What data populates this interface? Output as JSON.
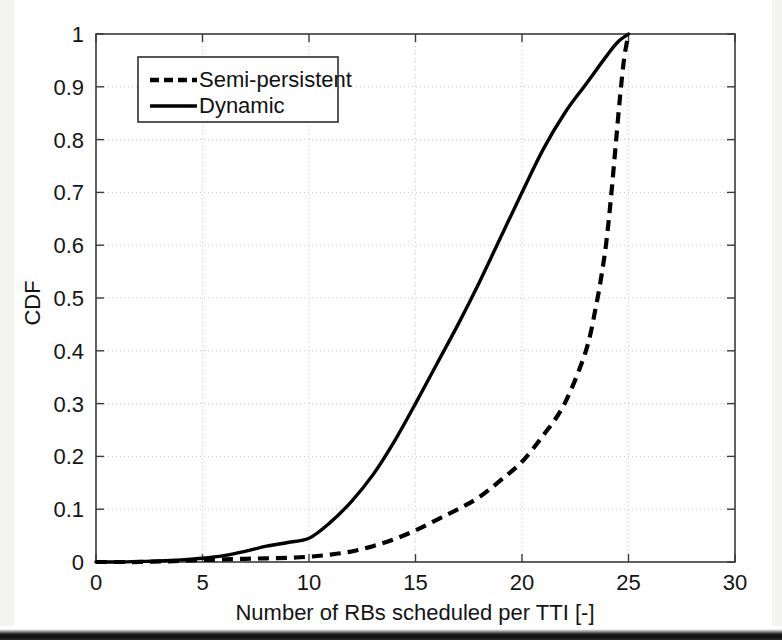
{
  "chart_data": {
    "type": "line",
    "title": "",
    "xlabel": "Number of RBs scheduled per TTI [-]",
    "ylabel": "CDF",
    "xlim": [
      0,
      30
    ],
    "ylim": [
      0,
      1
    ],
    "grid": true,
    "legend_position": "top-left",
    "xticks": [
      "0",
      "5",
      "10",
      "15",
      "20",
      "25",
      "30"
    ],
    "xtick_values": [
      0,
      5,
      10,
      15,
      20,
      25,
      30
    ],
    "yticks": [
      "0",
      "0.1",
      "0.2",
      "0.3",
      "0.4",
      "0.5",
      "0.6",
      "0.7",
      "0.8",
      "0.9",
      "1"
    ],
    "ytick_values": [
      0,
      0.1,
      0.2,
      0.3,
      0.4,
      0.5,
      0.6,
      0.7,
      0.8,
      0.9,
      1.0
    ],
    "series": [
      {
        "name": "Semi-persistent",
        "style": "dashed",
        "color": "#000000",
        "x": [
          0,
          1,
          2,
          3,
          4,
          5,
          6,
          7,
          8,
          9,
          10,
          11,
          12,
          13,
          14,
          15,
          16,
          17,
          18,
          19,
          20,
          21,
          22,
          23,
          23.5,
          23.8,
          24.0,
          24.2,
          24.4,
          24.6,
          24.8,
          25.0
        ],
        "values": [
          0.0,
          0.0,
          0.0,
          0.001,
          0.002,
          0.004,
          0.005,
          0.006,
          0.007,
          0.008,
          0.01,
          0.014,
          0.02,
          0.03,
          0.043,
          0.06,
          0.08,
          0.1,
          0.123,
          0.155,
          0.19,
          0.24,
          0.3,
          0.4,
          0.49,
          0.56,
          0.62,
          0.7,
          0.79,
          0.88,
          0.955,
          1.0
        ]
      },
      {
        "name": "Dynamic",
        "style": "solid",
        "color": "#000000",
        "x": [
          0,
          1,
          2,
          3,
          4,
          5,
          6,
          7,
          8,
          9,
          10,
          11,
          12,
          13,
          14,
          15,
          16,
          17,
          18,
          19,
          20,
          21,
          22,
          23,
          24,
          24.5,
          25.0
        ],
        "values": [
          0.0,
          0.0,
          0.001,
          0.002,
          0.004,
          0.007,
          0.012,
          0.02,
          0.03,
          0.037,
          0.045,
          0.075,
          0.115,
          0.165,
          0.228,
          0.3,
          0.375,
          0.45,
          0.53,
          0.615,
          0.7,
          0.782,
          0.85,
          0.905,
          0.96,
          0.985,
          1.0
        ]
      }
    ]
  },
  "legend": {
    "items": [
      {
        "label": "Semi-persistent",
        "style": "dashed"
      },
      {
        "label": "Dynamic",
        "style": "solid"
      }
    ]
  }
}
